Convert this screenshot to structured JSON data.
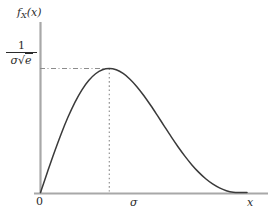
{
  "figure": {
    "kind": "rayleigh-pdf-plot",
    "background_color": "#ffffff",
    "curve_color": "#3a3a3a",
    "axis_color": "#a8a8a8",
    "guide_color": "#9a9a9a",
    "text_color": "#2b2b2b"
  },
  "labels": {
    "y_axis_label": "f",
    "y_axis_label_sub": "X",
    "y_axis_label_arg": "(x)",
    "x_axis_label": "x",
    "x_tick_origin": "0",
    "x_tick_sigma": "σ",
    "y_tick_numerator": "1",
    "y_tick_denominator_sigma": "σ",
    "y_tick_denominator_radical": "√",
    "y_tick_denominator_radicand": "e"
  },
  "chart_data": {
    "type": "line",
    "title": "",
    "xlabel": "x",
    "ylabel": "f_X(x)",
    "xlim": [
      0,
      4.0
    ],
    "ylim": [
      0,
      0.72
    ],
    "grid": false,
    "legend": null,
    "xticks": [
      0,
      1
    ],
    "xticklabels": [
      "0",
      "σ"
    ],
    "yticks": [
      0.6065
    ],
    "yticklabels": [
      "1/(σ√e)"
    ],
    "annotations": [
      {
        "type": "dashdot-horizontal",
        "y": 0.6065,
        "x_from": 0,
        "x_to": 1,
        "label": "1/(σ√e)"
      },
      {
        "type": "dotted-vertical",
        "x": 1,
        "y_from": 0,
        "y_to": 0.6065,
        "label": "σ"
      }
    ],
    "series": [
      {
        "name": "Rayleigh pdf (sigma=1)",
        "formula": "f(x) = (x/sigma^2) exp(-x^2/(2 sigma^2))",
        "peak": {
          "x": 1.0,
          "y": 0.6065
        },
        "x": [
          0.0,
          0.1,
          0.2,
          0.3,
          0.4,
          0.5,
          0.6,
          0.7,
          0.8,
          0.9,
          1.0,
          1.1,
          1.2,
          1.3,
          1.4,
          1.5,
          1.6,
          1.7,
          1.8,
          1.9,
          2.0,
          2.1,
          2.2,
          2.3,
          2.4,
          2.5,
          2.6,
          2.7,
          2.8,
          2.9,
          3.0,
          3.1,
          3.2,
          3.3,
          3.4,
          3.5
        ],
        "y": [
          0.0,
          0.0995,
          0.196,
          0.2868,
          0.3692,
          0.4412,
          0.5011,
          0.5477,
          0.5809,
          0.6006,
          0.6065,
          0.6,
          0.5821,
          0.5542,
          0.5178,
          0.4747,
          0.4267,
          0.3759,
          0.3239,
          0.2724,
          0.2231,
          0.1771,
          0.1354,
          0.0988,
          0.0677,
          0.0424,
          0.0231,
          0.0094,
          0.0016,
          0.0,
          0.0,
          0.0,
          0.0,
          0.0,
          0.0,
          0.0
        ]
      }
    ]
  }
}
